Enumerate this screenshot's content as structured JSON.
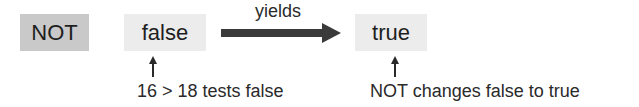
{
  "diagram": {
    "operator": {
      "label": "NOT",
      "fill": "#c9c9c9"
    },
    "input": {
      "label": "false",
      "fill": "#ececec"
    },
    "connector": {
      "label": "yields",
      "icon": "right-arrow-icon"
    },
    "output": {
      "label": "true",
      "fill": "#ececec"
    },
    "annotations": [
      {
        "target": "input",
        "text": "16 > 18 tests false",
        "icon": "up-arrow-icon"
      },
      {
        "target": "output",
        "text": "NOT changes false to true",
        "icon": "up-arrow-icon"
      }
    ]
  }
}
